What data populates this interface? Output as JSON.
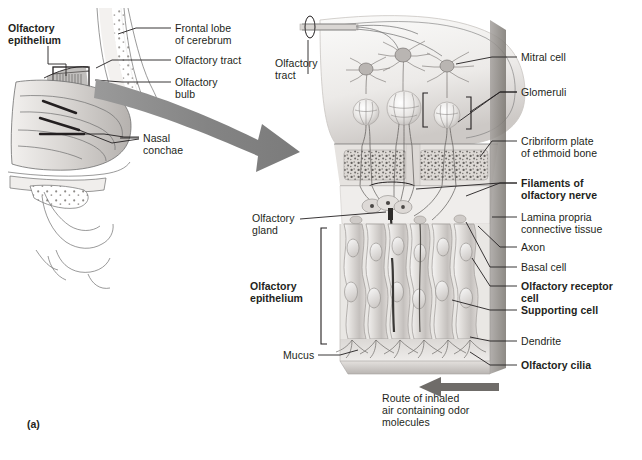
{
  "figure": {
    "panel_letter": "(a)",
    "title_alt": "Olfactory epithelium and olfactory bulb anatomy"
  },
  "left_panel": {
    "name": "sagittal-head-section",
    "labels": [
      {
        "id": "olfactory-epithelium",
        "text": "Olfactory\nepithelium",
        "bold": true,
        "x": 8,
        "y": 22,
        "align": "left"
      },
      {
        "id": "frontal-lobe",
        "text": "Frontal lobe\nof cerebrum",
        "bold": false,
        "x": 175,
        "y": 22,
        "align": "left"
      },
      {
        "id": "olfactory-tract",
        "text": "Olfactory tract",
        "bold": false,
        "x": 175,
        "y": 56,
        "align": "left"
      },
      {
        "id": "olfactory-bulb",
        "text": "Olfactory\nbulb",
        "bold": false,
        "x": 175,
        "y": 76,
        "align": "left"
      },
      {
        "id": "nasal-conchae",
        "text": "Nasal\nconchae",
        "bold": false,
        "x": 142,
        "y": 134,
        "align": "left"
      }
    ]
  },
  "right_panel": {
    "name": "olfactory-epithelium-detail",
    "labels_left": [
      {
        "id": "olfactory-tract-detail",
        "text": "Olfactory\ntract",
        "bold": false,
        "x": 275,
        "y": 57,
        "align": "left"
      },
      {
        "id": "olfactory-gland",
        "text": "Olfactory\ngland",
        "bold": false,
        "x": 253,
        "y": 213,
        "align": "left"
      },
      {
        "id": "olfactory-epithelium-detail",
        "text": "Olfactory\nepithelium",
        "bold": true,
        "x": 252,
        "y": 281,
        "align": "left"
      },
      {
        "id": "mucus",
        "text": "Mucus",
        "bold": false,
        "x": 283,
        "y": 349,
        "align": "left"
      }
    ],
    "labels_right": [
      {
        "id": "mitral-cell",
        "text": "Mitral cell",
        "bold": false,
        "x": 521,
        "y": 51
      },
      {
        "id": "glomeruli",
        "text": "Glomeruli",
        "bold": false,
        "x": 521,
        "y": 87
      },
      {
        "id": "cribriform-plate",
        "text": "Cribriform plate\nof ethmoid bone",
        "bold": false,
        "x": 521,
        "y": 135
      },
      {
        "id": "filaments-of-olfactory-nerve",
        "text": "Filaments of\nolfactory nerve",
        "bold": true,
        "x": 521,
        "y": 177
      },
      {
        "id": "lamina-propria",
        "text": "Lamina propria\nconnective tissue",
        "bold": false,
        "x": 521,
        "y": 211
      },
      {
        "id": "axon",
        "text": "Axon",
        "bold": false,
        "x": 521,
        "y": 241
      },
      {
        "id": "basal-cell",
        "text": "Basal cell",
        "bold": false,
        "x": 521,
        "y": 261
      },
      {
        "id": "olfactory-receptor-cell",
        "text": "Olfactory receptor\ncell",
        "bold": true,
        "x": 521,
        "y": 280
      },
      {
        "id": "supporting-cell",
        "text": "Supporting cell",
        "bold": true,
        "x": 521,
        "y": 304
      },
      {
        "id": "dendrite",
        "text": "Dendrite",
        "bold": false,
        "x": 521,
        "y": 335
      },
      {
        "id": "olfactory-cilia",
        "text": "Olfactory cilia",
        "bold": true,
        "x": 521,
        "y": 359
      }
    ],
    "caption": {
      "id": "route-of-inhaled-air",
      "text": "Route of inhaled\nair containing odor\nmolecules",
      "x": 382,
      "y": 392
    }
  },
  "colors": {
    "ink": "#231f20",
    "arrow_gray": "#8a8a8a",
    "tissue_light": "#e8e6e4",
    "tissue_mid": "#cfccc9",
    "tissue_dark": "#a8a4a1",
    "bone_speckle": "#6e6b68",
    "background": "#ffffff"
  }
}
